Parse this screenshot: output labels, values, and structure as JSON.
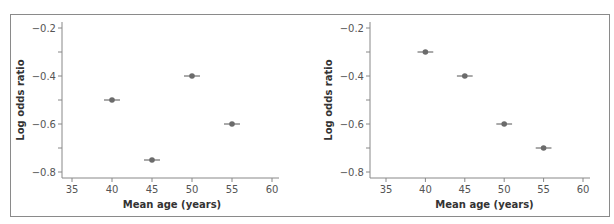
{
  "chart_data": [
    {
      "type": "scatter",
      "title": "",
      "xlabel": "Mean age (years)",
      "ylabel": "Log odds ratio",
      "xlim": [
        34,
        61
      ],
      "ylim": [
        -0.825,
        -0.18
      ],
      "xticks": [
        35,
        40,
        45,
        50,
        55,
        60
      ],
      "yticks": [
        -0.2,
        -0.3,
        -0.4,
        -0.5,
        -0.6,
        -0.7,
        -0.8
      ],
      "ytick_labels": [
        "-0.2",
        "",
        "-0.4",
        "",
        "-0.6",
        "",
        "-0.8"
      ],
      "grid": false,
      "series": [
        {
          "name": "left panel",
          "x": [
            40,
            45,
            50,
            55
          ],
          "y": [
            -0.5,
            -0.75,
            -0.4,
            -0.6
          ],
          "xerr": [
            1,
            1,
            1,
            1
          ]
        }
      ]
    },
    {
      "type": "scatter",
      "title": "",
      "xlabel": "Mean age (years)",
      "ylabel": "Log odds ratio",
      "xlim": [
        34,
        61
      ],
      "ylim": [
        -0.825,
        -0.18
      ],
      "xticks": [
        35,
        40,
        45,
        50,
        55,
        60
      ],
      "yticks": [
        -0.2,
        -0.3,
        -0.4,
        -0.5,
        -0.6,
        -0.7,
        -0.8
      ],
      "ytick_labels": [
        "-0.2",
        "",
        "-0.4",
        "",
        "-0.6",
        "",
        "-0.8"
      ],
      "grid": false,
      "series": [
        {
          "name": "right panel",
          "x": [
            40,
            45,
            50,
            55
          ],
          "y": [
            -0.3,
            -0.4,
            -0.6,
            -0.7
          ],
          "xerr": [
            1,
            1,
            1,
            1
          ]
        }
      ]
    }
  ],
  "colors": {
    "point": "#6b6b6b",
    "axis": "#888888",
    "frame": "#8a8a8a"
  }
}
